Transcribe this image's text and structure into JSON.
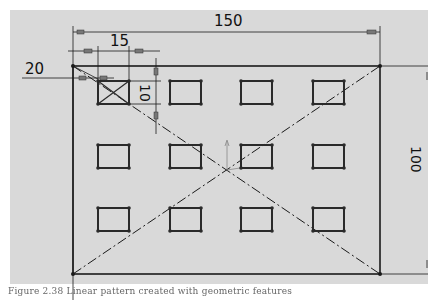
{
  "drawing": {
    "background": "#d9d9d9",
    "line_color": "#1a1a1a",
    "dimensions": {
      "overall_width": "150",
      "overall_height": "100",
      "cell_spacing": "15",
      "edge_offset": "20",
      "cutout_height": "10"
    },
    "pattern": {
      "rows": 3,
      "columns": 4,
      "cutout_shape": "rectangle",
      "seed_cutout_marker": "x-cross"
    },
    "center_lines": "dash-dot diagonals"
  },
  "caption": "Figure 2.38 Linear pattern created with geometric features"
}
